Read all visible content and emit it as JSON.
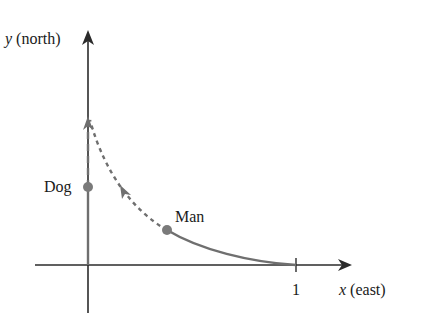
{
  "diagram": {
    "type": "pursuit-curve",
    "axes": {
      "y_label_var": "y",
      "y_label_dir": " (north)",
      "x_label_var": "x",
      "x_label_dir": " (east)",
      "x_tick_label": "1"
    },
    "points": {
      "dog_label": "Dog",
      "man_label": "Man"
    },
    "colors": {
      "axis": "#2b2b2b",
      "path": "#6f6f6f",
      "dot": "#7a7a7a",
      "text": "#1a1a1a"
    }
  }
}
